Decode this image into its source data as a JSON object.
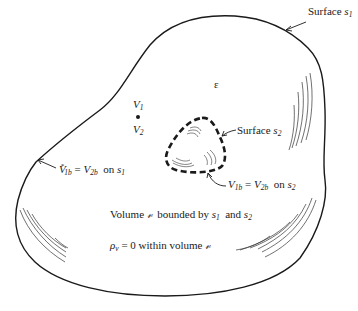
{
  "diagram": {
    "outer_surface": {
      "label_prefix": "Surface",
      "label_var": "s",
      "label_sub": "1"
    },
    "inner_surface": {
      "label_prefix": "Surface",
      "label_var": "s",
      "label_sub": "2",
      "style": "dashed"
    },
    "permittivity_symbol": "ε",
    "point": {
      "v1_var": "V",
      "v1_sub": "1",
      "v2_var": "V",
      "v2_sub": "2"
    },
    "boundary_s1": {
      "lhs_var": "V",
      "lhs_sup": "*",
      "lhs_sub": "1b",
      "eq": " = ",
      "rhs_var": "V",
      "rhs_sub": "2b",
      "on": "  on ",
      "surf_var": "s",
      "surf_sub": "1"
    },
    "boundary_s2": {
      "lhs_var": "V",
      "lhs_sub": "1b",
      "eq": " = ",
      "rhs_var": "V",
      "rhs_sub": "2b",
      "on": "  on ",
      "surf_var": "s",
      "surf_sub": "2"
    },
    "volume_statement": {
      "word": "Volume ",
      "vol_symbol": "𝓋",
      "middle": "  bounded by ",
      "s1_var": "s",
      "s1_sub": "1",
      "and": "  and ",
      "s2_var": "s",
      "s2_sub": "2"
    },
    "charge_statement": {
      "rho": "ρ",
      "rho_sub": "v",
      "rest": " = 0 within volume ",
      "vol_symbol": "𝓋"
    },
    "colors": {
      "ink": "#1a1a1a",
      "background": "#ffffff"
    }
  }
}
